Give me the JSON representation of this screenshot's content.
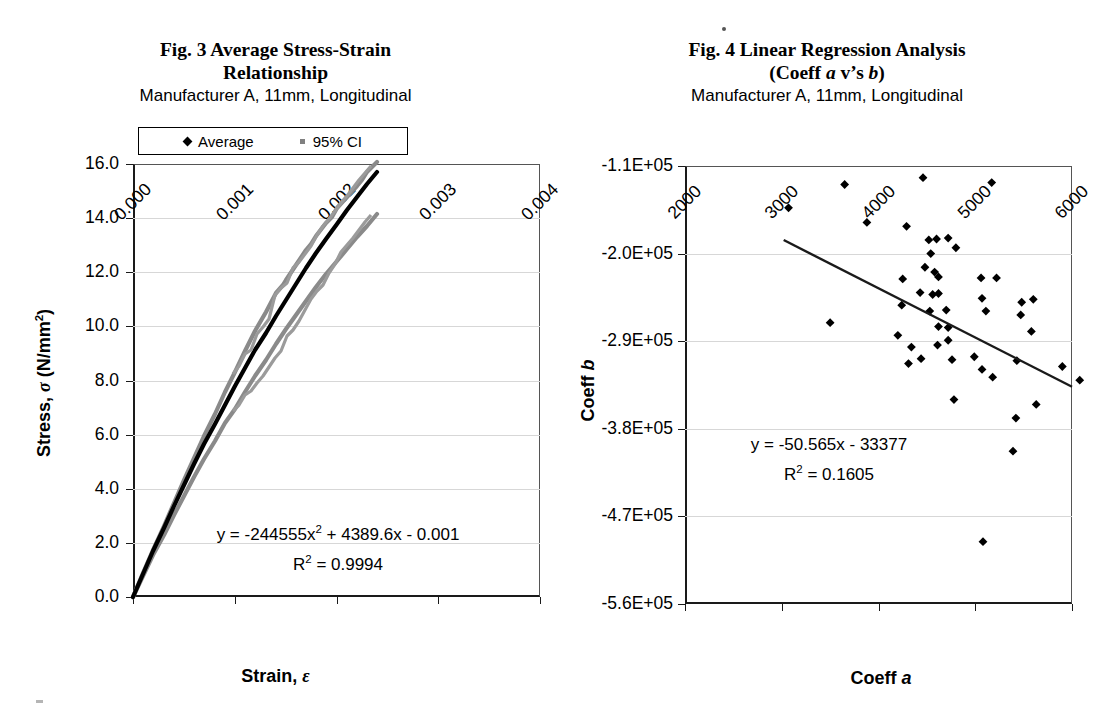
{
  "figures": [
    {
      "id": "fig3",
      "title_line1": "Fig. 3 Average Stress-Strain",
      "title_line2": "Relationship",
      "subtitle": "Manufacturer A, 11mm, Longitudinal",
      "legend": [
        {
          "label": "Average",
          "marker": "diamond-marker-icon",
          "color": "#000000"
        },
        {
          "label": "95% CI",
          "marker": "square-marker-icon",
          "color": "#808080"
        }
      ],
      "equation": "y = -244555x",
      "equation_sup": "2",
      "equation_tail": " + 4389.6x - 0.001",
      "r2_label": "R",
      "r2_sup": "2",
      "r2_tail": " = 0.9994",
      "xaxis_title_main": "Strain, ",
      "xaxis_title_symbol": "ε",
      "yaxis_title_main": "Stress, ",
      "yaxis_title_symbol": "σ",
      "yaxis_title_units": " (N/mm",
      "yaxis_title_units_sup": "2",
      "yaxis_title_units_tail": ")",
      "yticks": [
        "0.0",
        "2.0",
        "4.0",
        "6.0",
        "8.0",
        "10.0",
        "12.0",
        "14.0",
        "16.0"
      ],
      "xticks": [
        "0.000",
        "0.001",
        "0.002",
        "0.003",
        "0.004"
      ]
    },
    {
      "id": "fig4",
      "title_line1": "Fig. 4 Linear Regression Analysis",
      "title_line2_pre": "(Coeff ",
      "title_line2_a": "a",
      "title_line2_mid": " v’s ",
      "title_line2_b": "b",
      "title_line2_post": ")",
      "subtitle": "Manufacturer A, 11mm, Longitudinal",
      "equation": "y = -50.565x - 33377",
      "r2_label": "R",
      "r2_sup": "2",
      "r2_tail": " = 0.1605",
      "xaxis_title_main": "Coeff ",
      "xaxis_title_symbol": "a",
      "yaxis_title_main": "Coeff ",
      "yaxis_title_symbol": "b",
      "yticks": [
        "-5.6E+05",
        "-4.7E+05",
        "-3.8E+05",
        "-2.9E+05",
        "-2.0E+05",
        "-1.1E+05"
      ],
      "xticks": [
        "2000",
        "3000",
        "4000",
        "5000",
        "6000"
      ]
    }
  ],
  "chart_data": [
    {
      "type": "line",
      "title": "Fig. 3 Average Stress-Strain Relationship",
      "subtitle": "Manufacturer A, 11mm, Longitudinal",
      "xlabel": "Strain, ε",
      "ylabel": "Stress, σ (N/mm2)",
      "xlim": [
        0.0,
        0.004
      ],
      "ylim": [
        0.0,
        16.0
      ],
      "xticks": [
        0.0,
        0.001,
        0.002,
        0.003,
        0.004
      ],
      "yticks": [
        0.0,
        2.0,
        4.0,
        6.0,
        8.0,
        10.0,
        12.0,
        14.0,
        16.0
      ],
      "grid": true,
      "legend_position": "top",
      "annotation": "y = -244555x^2 + 4389.6x - 0.001 ; R^2 = 0.9994",
      "series": [
        {
          "name": "Average",
          "color": "#000000",
          "x": [
            0.0,
            0.0002,
            0.0004,
            0.0006,
            0.0008,
            0.001,
            0.0012,
            0.0014,
            0.0016,
            0.0018,
            0.002,
            0.0022,
            0.0024,
            0.0026,
            0.0028,
            0.003,
            0.0032,
            0.0034,
            0.0036,
            0.0038,
            0.004
          ],
          "y": [
            0.0,
            0.86,
            1.72,
            2.55,
            3.36,
            4.15,
            4.92,
            5.67,
            6.4,
            7.11,
            7.8,
            8.47,
            9.12,
            9.75,
            10.36,
            10.95,
            11.52,
            12.07,
            12.6,
            13.11,
            13.6
          ]
        },
        {
          "name": "95% CI upper",
          "color": "#808080",
          "x": [
            0.0,
            0.0002,
            0.0004,
            0.0006,
            0.0008,
            0.001,
            0.0012,
            0.0014,
            0.0016,
            0.0018,
            0.002,
            0.0022,
            0.0024,
            0.0026,
            0.0028,
            0.003,
            0.0032,
            0.0034,
            0.0036,
            0.0038,
            0.004
          ],
          "y": [
            0.0,
            0.95,
            1.9,
            2.81,
            3.72,
            4.6,
            5.45,
            6.3,
            7.1,
            7.9,
            8.67,
            9.42,
            10.16,
            10.87,
            11.56,
            12.25,
            12.95,
            13.65,
            14.3,
            14.75,
            15.2
          ]
        },
        {
          "name": "95% CI lower",
          "color": "#808080",
          "x": [
            0.0,
            0.0002,
            0.0004,
            0.0006,
            0.0008,
            0.001,
            0.0012,
            0.0014,
            0.0016,
            0.0018,
            0.002,
            0.0022,
            0.0024,
            0.0026,
            0.0028,
            0.003,
            0.0032,
            0.0034,
            0.0036,
            0.0038,
            0.004
          ],
          "y": [
            0.0,
            0.78,
            1.55,
            2.3,
            3.02,
            3.72,
            4.4,
            5.06,
            5.7,
            6.33,
            6.94,
            7.53,
            8.1,
            8.66,
            9.2,
            9.74,
            10.3,
            10.85,
            11.3,
            11.7,
            12.1
          ]
        }
      ]
    },
    {
      "type": "scatter",
      "title": "Fig. 4 Linear Regression Analysis (Coeff a v’s b)",
      "subtitle": "Manufacturer A, 11mm, Longitudinal",
      "xlabel": "Coeff a",
      "ylabel": "Coeff b",
      "xlim": [
        2000,
        6000
      ],
      "ylim": [
        -560000,
        -110000
      ],
      "xticks": [
        2000,
        3000,
        4000,
        5000,
        6000
      ],
      "yticks": [
        -560000,
        -470000,
        -380000,
        -290000,
        -200000,
        -110000
      ],
      "grid": true,
      "annotation": "y = -50.565x - 33377 ; R^2 = 0.1605",
      "trendline": {
        "slope": -50.565,
        "intercept": -33377,
        "x_start": 3020,
        "x_end": 6100
      },
      "points": [
        [
          3650,
          -129000
        ],
        [
          3070,
          -153000
        ],
        [
          4460,
          -122000
        ],
        [
          5170,
          -127000
        ],
        [
          3880,
          -168000
        ],
        [
          4290,
          -172000
        ],
        [
          4520,
          -186000
        ],
        [
          4600,
          -185000
        ],
        [
          4720,
          -184000
        ],
        [
          4800,
          -194000
        ],
        [
          4540,
          -200000
        ],
        [
          4480,
          -214000
        ],
        [
          4580,
          -219000
        ],
        [
          4620,
          -224000
        ],
        [
          4250,
          -226000
        ],
        [
          5060,
          -225000
        ],
        [
          5220,
          -225000
        ],
        [
          4430,
          -240000
        ],
        [
          4560,
          -242000
        ],
        [
          4620,
          -241000
        ],
        [
          4240,
          -253000
        ],
        [
          5070,
          -246000
        ],
        [
          5480,
          -250000
        ],
        [
          5600,
          -247000
        ],
        [
          4530,
          -259000
        ],
        [
          4700,
          -258000
        ],
        [
          5110,
          -259000
        ],
        [
          5470,
          -263000
        ],
        [
          3500,
          -271000
        ],
        [
          4620,
          -275000
        ],
        [
          4720,
          -276000
        ],
        [
          4200,
          -284000
        ],
        [
          5580,
          -280000
        ],
        [
          4720,
          -289000
        ],
        [
          4340,
          -296000
        ],
        [
          4610,
          -294000
        ],
        [
          4440,
          -308000
        ],
        [
          4760,
          -309000
        ],
        [
          4990,
          -306000
        ],
        [
          4310,
          -313000
        ],
        [
          5070,
          -319000
        ],
        [
          5430,
          -310000
        ],
        [
          5900,
          -316000
        ],
        [
          5180,
          -327000
        ],
        [
          6080,
          -330000
        ],
        [
          4780,
          -350000
        ],
        [
          5630,
          -355000
        ],
        [
          5420,
          -369000
        ],
        [
          5390,
          -403000
        ],
        [
          5080,
          -496000
        ]
      ]
    }
  ]
}
